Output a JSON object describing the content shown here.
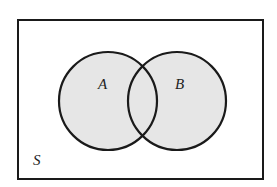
{
  "diagram": {
    "type": "venn",
    "universe_label": "S",
    "sets": [
      {
        "label": "A"
      },
      {
        "label": "B"
      }
    ],
    "colors": {
      "fill": "#e6e6e6",
      "stroke": "#1a1a1a",
      "background": "#ffffff"
    }
  }
}
